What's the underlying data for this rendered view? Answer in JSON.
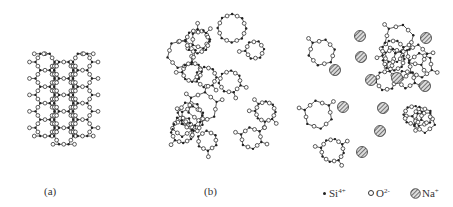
{
  "panels": [
    {
      "id": "a",
      "label": "(a)",
      "description": "crystalline silica network"
    },
    {
      "id": "b",
      "label": "(b)",
      "description": "amorphous silica glass network"
    },
    {
      "id": "c",
      "label": "",
      "description": "soda-silica glass network with Na+ ions"
    }
  ],
  "legend": [
    {
      "symbol": "small-filled-dot",
      "text": "Si",
      "sup": "4+"
    },
    {
      "symbol": "small-open-circle",
      "text": "O",
      "sup": "2-"
    },
    {
      "symbol": "large-hatched-circle",
      "text": "Na",
      "sup": "+"
    }
  ],
  "colors": {
    "line": "#333333",
    "background": "#ffffff",
    "hatch": "#555555"
  }
}
